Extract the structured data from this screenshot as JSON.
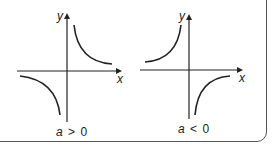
{
  "figure": {
    "panels": [
      {
        "id": "positive",
        "caption_var": "a",
        "caption_op": ">",
        "caption_val": "0",
        "x_label": "x",
        "y_label": "y",
        "branches": "quadrants I and III"
      },
      {
        "id": "negative",
        "caption_var": "a",
        "caption_op": "<",
        "caption_val": "0",
        "x_label": "x",
        "y_label": "y",
        "branches": "quadrants II and IV"
      }
    ],
    "colors": {
      "stroke": "#222222",
      "border": "#555555",
      "background": "#ffffff"
    }
  }
}
